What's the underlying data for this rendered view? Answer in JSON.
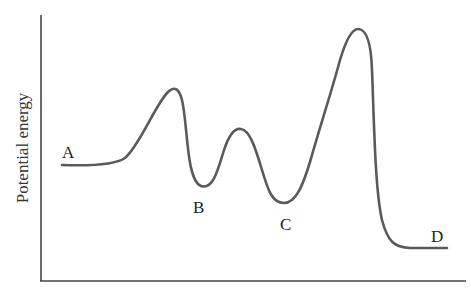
{
  "diagram": {
    "type": "potential-energy-profile",
    "y_axis_label": "Potential energy",
    "x_axis_label": "",
    "points": [
      {
        "label": "A",
        "role": "reactant / start",
        "x": 62,
        "y": 165
      },
      {
        "label": "",
        "role": "transition state 1",
        "x": 175,
        "y": 89
      },
      {
        "label": "B",
        "role": "intermediate 1",
        "x": 201,
        "y": 186
      },
      {
        "label": "",
        "role": "transition state 2",
        "x": 241,
        "y": 129
      },
      {
        "label": "C",
        "role": "intermediate 2",
        "x": 284,
        "y": 203
      },
      {
        "label": "",
        "role": "transition state 3 (highest)",
        "x": 358,
        "y": 29
      },
      {
        "label": "D",
        "role": "product / end",
        "x": 447,
        "y": 248
      }
    ],
    "labels": {
      "A": "A",
      "B": "B",
      "C": "C",
      "D": "D"
    },
    "colors": {
      "curve": "#5a5a5a",
      "axis": "#444444",
      "text": "#222222"
    }
  }
}
